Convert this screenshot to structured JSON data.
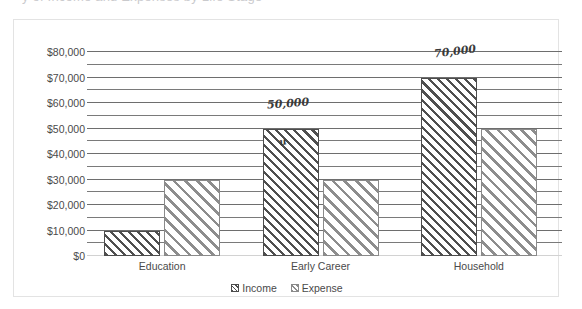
{
  "scan": {
    "cut_off_text_above": "y  of  Income  and  Expenses  by  Life  Stage"
  },
  "chart_data": {
    "type": "bar",
    "title": "",
    "xlabel": "",
    "ylabel": "",
    "categories": [
      "Education",
      "Early Career",
      "Household"
    ],
    "series": [
      {
        "name": "Income",
        "values": [
          10000,
          50000,
          70000
        ]
      },
      {
        "name": "Expense",
        "values": [
          30000,
          30000,
          50000
        ]
      }
    ],
    "ylim": [
      0,
      80000
    ],
    "y_tick_labels": [
      "$0",
      "$10,000",
      "$20,000",
      "$30,000",
      "$40,000",
      "$50,000",
      "$60,000",
      "$70,000",
      "$80,000"
    ],
    "y_tick_values": [
      0,
      10000,
      20000,
      30000,
      40000,
      50000,
      60000,
      70000,
      80000
    ],
    "y_minor_tick_values": [
      5000,
      15000,
      25000,
      35000,
      45000,
      55000,
      65000,
      75000
    ],
    "grid": true,
    "legend_position": "bottom",
    "legend_entries": [
      "Income",
      "Expense"
    ],
    "colors": {
      "income_border": "#4c4c4c",
      "income_hatch": "#4f4f4f",
      "expense_border": "#8a8a8a",
      "expense_hatch": "#8d8d8d",
      "gridline": "#6e6e6e",
      "frame_border": "#e3e3e3",
      "text": "#4a4a4a",
      "background": "#ffffff"
    }
  },
  "annotations": [
    {
      "id": "early-career-income-value",
      "text": "50,000",
      "series": "Income",
      "category": "Early Career",
      "x_pct": 45.8,
      "y_pct": 31.5,
      "rotate": -4,
      "size": 11
    },
    {
      "id": "early-career-income-check",
      "text": "u",
      "series": "Income",
      "category": "Early Career",
      "x_pct": 48.0,
      "y_pct": 44.0,
      "rotate": -14,
      "size": 10
    },
    {
      "id": "household-income-value",
      "text": "70,000",
      "series": "Income",
      "category": "Household",
      "x_pct": 74.5,
      "y_pct": 14.5,
      "rotate": -7,
      "size": 11
    }
  ]
}
